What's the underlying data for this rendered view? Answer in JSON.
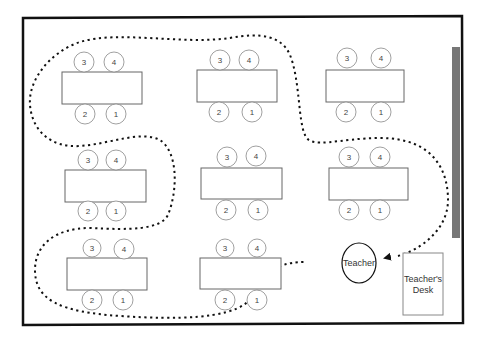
{
  "diagram": {
    "type": "classroom-seating-plan",
    "room": {
      "border_color": "#111111"
    },
    "whiteboard": {
      "color": "#777777"
    },
    "teacher": {
      "label": "Teacher"
    },
    "teacher_desk": {
      "line1": "Teacher's",
      "line2": "Desk"
    },
    "path": {
      "style": "dotted",
      "color": "#111111",
      "arrow_target": "Teacher"
    },
    "tables": [
      {
        "id": "table-1",
        "top_seats": [
          "3",
          "4"
        ],
        "bottom_seats": [
          "2",
          "1"
        ]
      },
      {
        "id": "table-2",
        "top_seats": [
          "3",
          "4"
        ],
        "bottom_seats": [
          "2",
          "1"
        ]
      },
      {
        "id": "table-3",
        "top_seats": [
          "3",
          "4"
        ],
        "bottom_seats": [
          "2",
          "1"
        ]
      },
      {
        "id": "table-4",
        "top_seats": [
          "3",
          "4"
        ],
        "bottom_seats": [
          "2",
          "1"
        ]
      },
      {
        "id": "table-5",
        "top_seats": [
          "3",
          "4"
        ],
        "bottom_seats": [
          "2",
          "1"
        ]
      },
      {
        "id": "table-6",
        "top_seats": [
          "3",
          "4"
        ],
        "bottom_seats": [
          "2",
          "1"
        ]
      },
      {
        "id": "table-7",
        "top_seats": [
          "3",
          "4"
        ],
        "bottom_seats": [
          "2",
          "1"
        ]
      },
      {
        "id": "table-8",
        "top_seats": [
          "3",
          "4"
        ],
        "bottom_seats": [
          "2",
          "1"
        ]
      }
    ]
  }
}
